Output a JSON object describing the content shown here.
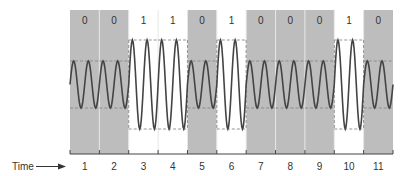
{
  "diagram": {
    "time_label": "Time",
    "bits": [
      "0",
      "0",
      "1",
      "1",
      "0",
      "1",
      "0",
      "0",
      "0",
      "1",
      "0"
    ],
    "time_ticks": [
      "1",
      "2",
      "3",
      "4",
      "5",
      "6",
      "7",
      "8",
      "9",
      "10",
      "11"
    ],
    "cycles_per_bit": 2,
    "amplitude": {
      "bit_0": "low",
      "bit_1": "high"
    },
    "colors": {
      "zero_bg": "#bdbdbd",
      "one_bg": "#ffffff",
      "wave": "#444444",
      "dashed": "#888888",
      "axis": "#444444",
      "divider": "#e6e6e6",
      "text": "#333333"
    }
  }
}
